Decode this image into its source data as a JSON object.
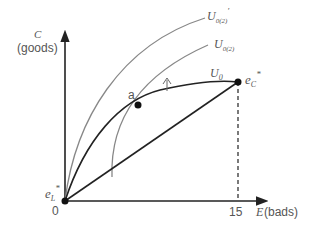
{
  "diagram": {
    "y_axis": {
      "symbol": "C",
      "label": "(goods)"
    },
    "x_axis": {
      "symbol": "E",
      "label": "(bads)",
      "tick": "15"
    },
    "origin_label": "0",
    "points": {
      "a": "a",
      "e_c": {
        "base": "e",
        "sub": "C",
        "sup": "*"
      },
      "e_l": {
        "base": "e",
        "sub": "L",
        "sup": "*"
      }
    },
    "curves": {
      "u0": {
        "base": "U",
        "sub": "0"
      },
      "u0_2": {
        "base": "U",
        "sub": "0(2)"
      },
      "u0_2_prime": {
        "base": "U",
        "sub": "0(2)",
        "sup": "′"
      }
    },
    "colors": {
      "axis": "#222222",
      "gray_curve": "#888888",
      "black_curve": "#222222",
      "text": "#555555"
    }
  }
}
